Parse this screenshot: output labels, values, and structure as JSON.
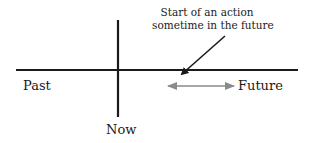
{
  "diagram": {
    "labels": {
      "past": "Past",
      "now": "Now",
      "future": "Future",
      "annotation_line1": "Start of an action",
      "annotation_line2": "sometime in the future"
    },
    "colors": {
      "line": "#1a1a1a",
      "range_arrow": "#8a8a8a",
      "background": "#ffffff"
    }
  }
}
